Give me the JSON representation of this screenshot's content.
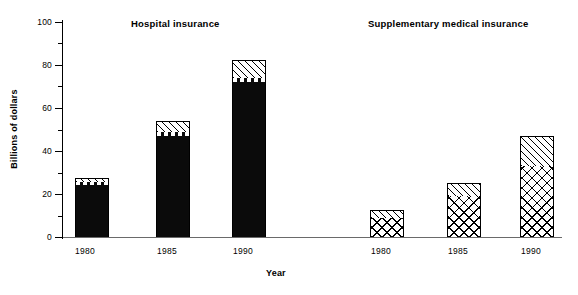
{
  "chart_data": {
    "type": "bar",
    "title": "",
    "subtitle": "",
    "xlabel": "Year",
    "ylabel": "Billions of dollars",
    "ylim": [
      0,
      100
    ],
    "ytick_labels": [
      "0",
      "20",
      "40",
      "60",
      "80",
      "100"
    ],
    "ytick_values": [
      0,
      20,
      40,
      60,
      80,
      100
    ],
    "yminor_values": [
      10,
      30,
      50,
      70,
      90
    ],
    "grid": false,
    "legend_position": "none",
    "stacked": true,
    "categories": [
      "1980",
      "1985",
      "1990"
    ],
    "groups": [
      {
        "name": "Hospital insurance",
        "label": "Hospital insurance",
        "bars": [
          {
            "category": "1980",
            "total": 27.5,
            "segments": [
              {
                "name": "solid",
                "pattern": "solid-black",
                "value": 24.0
              },
              {
                "name": "dashed",
                "pattern": "white-dashed",
                "value": 1.5
              },
              {
                "name": "diagonal",
                "pattern": "diagonal-hatch",
                "value": 2.0
              }
            ]
          },
          {
            "category": "1985",
            "total": 54.0,
            "segments": [
              {
                "name": "solid",
                "pattern": "solid-black",
                "value": 47.0
              },
              {
                "name": "dashed",
                "pattern": "white-dashed",
                "value": 2.0
              },
              {
                "name": "diagonal",
                "pattern": "diagonal-hatch",
                "value": 5.0
              }
            ]
          },
          {
            "category": "1990",
            "total": 82.5,
            "segments": [
              {
                "name": "solid",
                "pattern": "solid-black",
                "value": 72.0
              },
              {
                "name": "dashed",
                "pattern": "white-dashed",
                "value": 2.0
              },
              {
                "name": "diagonal",
                "pattern": "diagonal-hatch",
                "value": 8.5
              }
            ]
          }
        ]
      },
      {
        "name": "Supplementary medical insurance",
        "label": "Supplementary medical insurance",
        "bars": [
          {
            "category": "1980",
            "total": 12.5,
            "segments": [
              {
                "name": "crosshatch",
                "pattern": "cross-hatch",
                "value": 9.0
              },
              {
                "name": "diagonal",
                "pattern": "diagonal-hatch",
                "value": 3.5
              }
            ]
          },
          {
            "category": "1985",
            "total": 25.0,
            "segments": [
              {
                "name": "crosshatch",
                "pattern": "cross-hatch",
                "value": 19.0
              },
              {
                "name": "diagonal",
                "pattern": "diagonal-hatch",
                "value": 6.0
              }
            ]
          },
          {
            "category": "1990",
            "total": 47.0,
            "segments": [
              {
                "name": "crosshatch",
                "pattern": "cross-hatch",
                "value": 33.0
              },
              {
                "name": "diagonal",
                "pattern": "diagonal-hatch",
                "value": 14.0
              }
            ]
          }
        ]
      }
    ]
  },
  "axes": {
    "y": {
      "title": "Billions of dollars",
      "ticks": [
        "100",
        "80",
        "60",
        "40",
        "20",
        "0"
      ]
    },
    "x": {
      "title": "Year",
      "ticks_hospital": [
        "1980",
        "1985",
        "1990"
      ],
      "ticks_smi": [
        "1980",
        "1985",
        "1990"
      ]
    }
  },
  "headings": {
    "hospital": "Hospital insurance",
    "smi": "Supplementary medical insurance"
  },
  "colors": {
    "ink": "#000000",
    "bar_solid": "#0b0b0b",
    "background": "#ffffff",
    "axis": "#6a6a6a"
  }
}
